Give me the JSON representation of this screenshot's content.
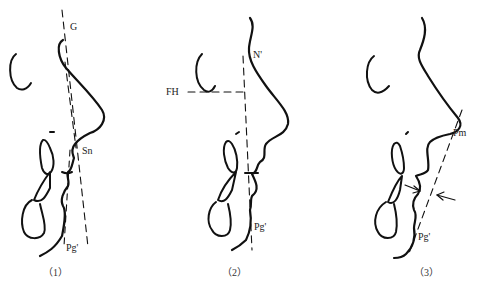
{
  "panels": [
    {
      "id": "1",
      "caption": "（1）",
      "labels": {
        "g": "G",
        "sn": "Sn",
        "pg": "Pg'"
      }
    },
    {
      "id": "2",
      "caption": "（2）",
      "labels": {
        "n": "N'",
        "fh": "FH",
        "pg": "Pg'"
      }
    },
    {
      "id": "3",
      "caption": "（3）",
      "labels": {
        "pm": "Pm",
        "pg": "Pg'"
      }
    }
  ],
  "colors": {
    "stroke": "#111111",
    "background": "#ffffff"
  }
}
